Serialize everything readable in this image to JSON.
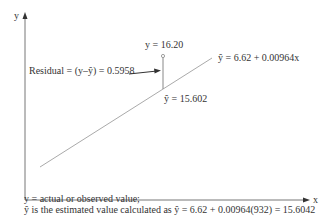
{
  "axes": {
    "y_label": "y",
    "x_label": "x"
  },
  "labels": {
    "actual_point": "y = 16.20",
    "residual": "Residual = (y–ŷ) = 0.5958",
    "regression_equation": "ŷ = 6.62 + 0.00964x",
    "predicted_point": "ŷ = 15.602"
  },
  "caption": {
    "line1": "y = actual or observed value;",
    "line2": "ŷ is the estimated value calculated as ŷ = 6.62 + 0.00964(932) = 15.6042"
  },
  "colors": {
    "axis": "#555555",
    "regression_line": "#999999",
    "text": "#333333"
  }
}
